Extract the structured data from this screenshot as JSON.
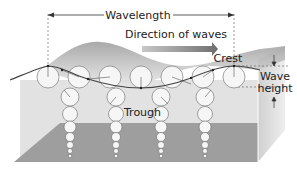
{
  "labels": {
    "wavelength": "Wavelength",
    "direction": "Direction of waves",
    "crest": "Crest",
    "trough": "Trough",
    "wave_height_line1": "Wave",
    "wave_height_line2": "height"
  },
  "colors": {
    "background": "#ffffff",
    "water_upper": "#dcdcdc",
    "water_lower": "#9c9c9c",
    "water_side": "#bfbfbf",
    "wave_surface": "#b8b8b8",
    "wave_line": "#4a4a4a",
    "arrow": "#8a8a8a",
    "circle_fill": "#f4f4f4",
    "circle_stroke": "#666666",
    "text": "#222222"
  }
}
